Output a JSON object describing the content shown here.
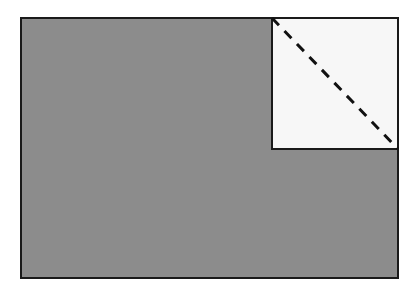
{
  "diagram": {
    "outer_rect": {
      "x": 21,
      "y": 18,
      "width": 377,
      "height": 260,
      "fill": "#8c8c8c",
      "stroke": "#1a1a1a"
    },
    "inset_rect": {
      "x": 272,
      "y": 18,
      "width": 126,
      "height": 131,
      "fill": "#f7f7f7",
      "stroke": "#1a1a1a"
    },
    "diagonal": {
      "x1": 272,
      "y1": 18,
      "x2": 398,
      "y2": 149,
      "stroke": "#111111",
      "dash": "10,8"
    }
  }
}
